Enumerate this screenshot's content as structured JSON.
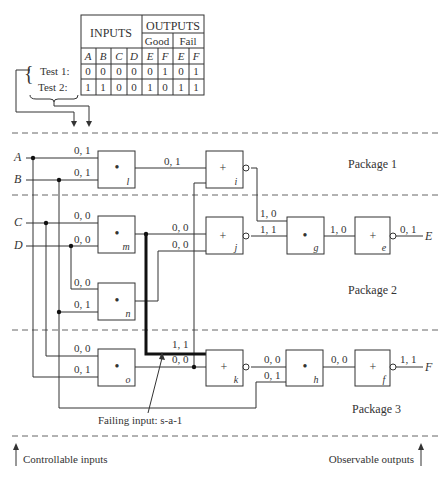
{
  "table": {
    "header_inputs": "INPUTS",
    "header_outputs": "OUTPUTS",
    "header_good": "Good",
    "header_fail": "Fail",
    "columns": [
      "A",
      "B",
      "C",
      "D",
      "E",
      "F",
      "E",
      "F"
    ],
    "rows": [
      {
        "label": "Test 1:",
        "values": [
          "0",
          "0",
          "0",
          "0",
          "0",
          "1",
          "0",
          "1"
        ]
      },
      {
        "label": "Test 2:",
        "values": [
          "1",
          "1",
          "0",
          "0",
          "1",
          "0",
          "1",
          "1"
        ]
      }
    ]
  },
  "inputs": {
    "A": "A",
    "B": "B",
    "C": "C",
    "D": "D"
  },
  "outputs": {
    "E": "E",
    "F": "F"
  },
  "packages": {
    "p1": "Package 1",
    "p2": "Package 2",
    "p3": "Package 3"
  },
  "gates": {
    "l": {
      "name": "l",
      "op": "•"
    },
    "i": {
      "name": "i",
      "op": "+"
    },
    "m": {
      "name": "m",
      "op": "•"
    },
    "n": {
      "name": "n",
      "op": "•"
    },
    "j": {
      "name": "j",
      "op": "+"
    },
    "g": {
      "name": "g",
      "op": "•"
    },
    "e": {
      "name": "e",
      "op": "+"
    },
    "o": {
      "name": "o",
      "op": "•"
    },
    "k": {
      "name": "k",
      "op": "+"
    },
    "h": {
      "name": "h",
      "op": "•"
    },
    "f": {
      "name": "f",
      "op": "+"
    }
  },
  "signals": {
    "A_in": "0, 1",
    "B_in": "0, 1",
    "l_out": "0, 1",
    "C_in": "0, 0",
    "D_in": "0, 0",
    "m_out": "0, 0",
    "n_out": "0, 0",
    "n_in1": "0, 0",
    "n_in2": "0, 1",
    "i_out": "1, 0",
    "j_out": "1, 1",
    "g_out": "1, 0",
    "e_out": "0, 1",
    "o_in1": "0, 0",
    "o_in2": "0, 1",
    "k_in1": "1, 1",
    "k_in2": "0, 0",
    "k_out": "0, 0",
    "h_in2": "0, 1",
    "h_out": "0, 0",
    "f_out": "1, 1"
  },
  "annotations": {
    "failing": "Failing input: s-a-1",
    "controllable": "Controllable inputs",
    "observable": "Observable outputs",
    "brace": "{"
  }
}
